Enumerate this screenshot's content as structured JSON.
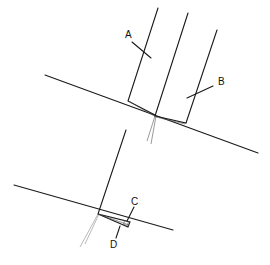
{
  "diagram": {
    "type": "geometric line drawing",
    "figures": [
      {
        "id": "upper",
        "labels": [
          {
            "id": "A",
            "text": "A",
            "x": 125,
            "y": 38
          },
          {
            "id": "B",
            "text": "B",
            "x": 218,
            "y": 85
          }
        ]
      },
      {
        "id": "lower",
        "labels": [
          {
            "id": "C",
            "text": "C",
            "x": 131,
            "y": 205
          },
          {
            "id": "D",
            "text": "D",
            "x": 110,
            "y": 248
          }
        ]
      }
    ],
    "colors": {
      "stroke": "#1a1a1a",
      "background": "#ffffff"
    }
  }
}
